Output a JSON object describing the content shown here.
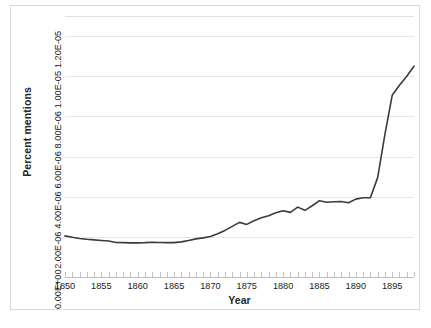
{
  "chart_data": {
    "type": "line",
    "title": "",
    "xlabel": "Year",
    "ylabel": "Percent mentions",
    "xlim": [
      1850,
      1898
    ],
    "ylim": [
      0,
      1.3e-05
    ],
    "grid": true,
    "legend": false,
    "series_color": "#3b3b3b",
    "gridline_color": "#e6e6e6",
    "y_tick_labels": [
      "0.00E+00",
      "2.00E-06",
      "4.00E-06",
      "6.00E-06",
      "8.00E-06",
      "1.00E-05",
      "1.20E-05"
    ],
    "y_tick_values": [
      0,
      2e-06,
      4e-06,
      6e-06,
      8e-06,
      1e-05,
      1.2e-05
    ],
    "x_tick_labels": [
      "1850",
      "1855",
      "1860",
      "1865",
      "1870",
      "1875",
      "1880",
      "1885",
      "1890",
      "1895"
    ],
    "x_tick_values": [
      1850,
      1855,
      1860,
      1865,
      1870,
      1875,
      1880,
      1885,
      1890,
      1895
    ],
    "x_minor_tick_step": 1,
    "series": [
      {
        "name": "Percent mentions",
        "x": [
          1850,
          1851,
          1852,
          1853,
          1854,
          1855,
          1856,
          1857,
          1858,
          1859,
          1860,
          1861,
          1862,
          1863,
          1864,
          1865,
          1866,
          1867,
          1868,
          1869,
          1870,
          1871,
          1872,
          1873,
          1874,
          1875,
          1876,
          1877,
          1878,
          1879,
          1880,
          1881,
          1882,
          1883,
          1884,
          1885,
          1886,
          1887,
          1888,
          1889,
          1890,
          1891,
          1892,
          1893,
          1894,
          1895,
          1896,
          1897,
          1898
        ],
        "values": [
          2.05e-06,
          1.98e-06,
          1.92e-06,
          1.88e-06,
          1.85e-06,
          1.82e-06,
          1.79e-06,
          1.72e-06,
          1.71e-06,
          1.7e-06,
          1.7e-06,
          1.71e-06,
          1.73e-06,
          1.72e-06,
          1.71e-06,
          1.71e-06,
          1.75e-06,
          1.82e-06,
          1.9e-06,
          1.95e-06,
          2.02e-06,
          2.15e-06,
          2.32e-06,
          2.52e-06,
          2.72e-06,
          2.62e-06,
          2.8e-06,
          2.95e-06,
          3.05e-06,
          3.2e-06,
          3.3e-06,
          3.22e-06,
          3.48e-06,
          3.32e-06,
          3.55e-06,
          3.8e-06,
          3.72e-06,
          3.75e-06,
          3.76e-06,
          3.7e-06,
          3.88e-06,
          3.95e-06,
          3.95e-06,
          4.95e-06,
          7.1e-06,
          9.05e-06,
          9.55e-06,
          1e-05,
          1.05e-05
        ]
      }
    ]
  }
}
